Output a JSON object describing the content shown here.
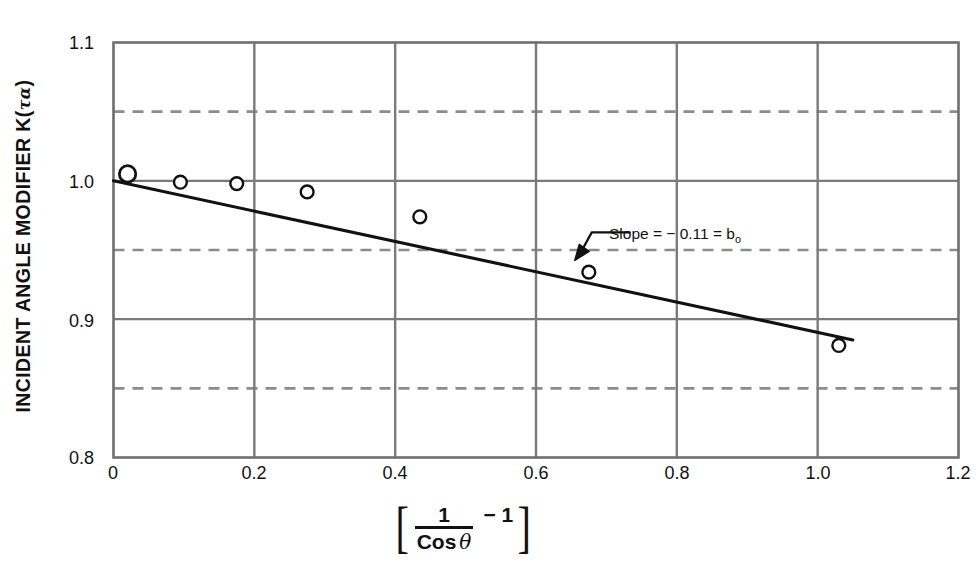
{
  "chart_data": {
    "type": "scatter",
    "title": "",
    "xlabel": "[ 1 / Cos θ − 1 ]",
    "ylabel": "INCIDENT ANGLE MODIFIER K(τα)",
    "xlim": [
      0,
      1.2
    ],
    "ylim": [
      0.8,
      1.1
    ],
    "xticks": [
      "0",
      "0.2",
      "0.4",
      "0.6",
      "0.8",
      "1.0",
      "1.2"
    ],
    "xtick_values": [
      0,
      0.2,
      0.4,
      0.6,
      0.8,
      1.0,
      1.2
    ],
    "yticks": [
      "1.1",
      "1.0",
      "0.9",
      "0.8"
    ],
    "ytick_values": [
      1.1,
      1.0,
      0.9,
      0.8
    ],
    "grid": "on",
    "gridlines_solid_y": [
      1.0,
      0.9
    ],
    "gridlines_dashed_y": [
      1.05,
      0.95,
      0.85
    ],
    "gridlines_solid_x": [
      0.2,
      0.4,
      0.6,
      0.8,
      1.0
    ],
    "legend": "none",
    "series": [
      {
        "name": "Measured data",
        "marker": "open-circle",
        "x": [
          0.02,
          0.095,
          0.175,
          0.275,
          0.435,
          0.675,
          1.03
        ],
        "y": [
          1.005,
          0.999,
          0.998,
          0.992,
          0.974,
          0.934,
          0.881
        ]
      },
      {
        "name": "Least-squares fit",
        "type": "line",
        "x": [
          0.0,
          1.05
        ],
        "y": [
          1.0,
          0.885
        ],
        "slope": -0.11,
        "intercept": 1.0
      }
    ],
    "annotations": [
      {
        "text": "Slope  =  − 0.11  = b",
        "subscript": "o",
        "x_text": 1.2,
        "y_text": 0.985,
        "arrow_tip_x": 0.655,
        "arrow_tip_y": 0.9425
      }
    ]
  },
  "axis": {
    "y_label_main": "INCIDENT ANGLE MODIFIER K(",
    "y_label_greek": "τα",
    "y_label_close": ")",
    "x_label_numerator": "1",
    "x_label_denominator": "Cos",
    "x_label_theta": "θ",
    "x_label_minus_one": "− 1",
    "bracket_left": "[",
    "bracket_right": "]"
  },
  "colors": {
    "axis": "#6e6e6e",
    "grid_solid": "#7a7a7a",
    "grid_dashed": "#8c8c8c",
    "data": "#111111",
    "text": "#111111",
    "background": "#ffffff"
  }
}
